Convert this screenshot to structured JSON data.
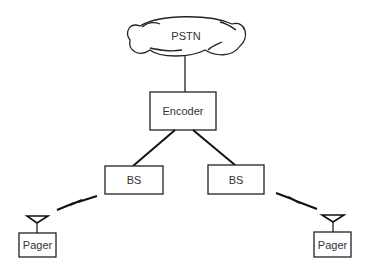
{
  "diagram": {
    "nodes": {
      "pstn": {
        "label": "PSTN",
        "shape": "cloud"
      },
      "encoder": {
        "label": "Encoder",
        "shape": "box"
      },
      "bs_left": {
        "label": "BS",
        "shape": "box"
      },
      "bs_right": {
        "label": "BS",
        "shape": "box"
      },
      "pager_left": {
        "label": "Pager",
        "shape": "box"
      },
      "pager_right": {
        "label": "Pager",
        "shape": "box"
      }
    },
    "edges": [
      {
        "from": "pstn",
        "to": "encoder",
        "type": "wired"
      },
      {
        "from": "encoder",
        "to": "bs_left",
        "type": "wired"
      },
      {
        "from": "encoder",
        "to": "bs_right",
        "type": "wired"
      },
      {
        "from": "bs_left",
        "to": "pager_left",
        "type": "wireless"
      },
      {
        "from": "bs_right",
        "to": "pager_right",
        "type": "wireless"
      }
    ]
  }
}
